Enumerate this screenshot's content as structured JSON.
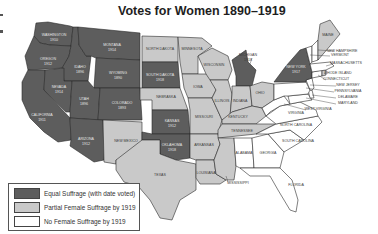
{
  "title": "Votes for Women 1890–1919",
  "colors": {
    "equal": "#5d5d5d",
    "partial": "#c9c9c9",
    "none": "#ffffff"
  },
  "legend": {
    "items": [
      {
        "key": "equal",
        "label": "Equal Suffrage (with date voted)"
      },
      {
        "key": "partial",
        "label": "Partial Female Suffrage by 1919"
      },
      {
        "key": "none",
        "label": "No Female Suffrage by 1919"
      }
    ]
  },
  "states": [
    {
      "id": "washington",
      "name": "WASHINGTON",
      "year": "1910",
      "status": "equal"
    },
    {
      "id": "oregon",
      "name": "OREGON",
      "year": "1912",
      "status": "equal"
    },
    {
      "id": "california",
      "name": "CALIFORNIA",
      "year": "1911",
      "status": "equal"
    },
    {
      "id": "idaho",
      "name": "IDAHO",
      "year": "1896",
      "status": "equal"
    },
    {
      "id": "nevada",
      "name": "NEVADA",
      "year": "1914",
      "status": "equal"
    },
    {
      "id": "montana",
      "name": "MONTANA",
      "year": "1914",
      "status": "equal"
    },
    {
      "id": "wyoming",
      "name": "WYOMING",
      "year": "1890",
      "status": "equal"
    },
    {
      "id": "utah",
      "name": "UTAH",
      "year": "1896",
      "status": "equal"
    },
    {
      "id": "colorado",
      "name": "COLORADO",
      "year": "1893",
      "status": "equal"
    },
    {
      "id": "arizona",
      "name": "ARIZONA",
      "year": "1912",
      "status": "equal"
    },
    {
      "id": "new-mexico",
      "name": "NEW MEXICO",
      "year": "",
      "status": "partial"
    },
    {
      "id": "north-dakota",
      "name": "NORTH DAKOTA",
      "year": "",
      "status": "partial"
    },
    {
      "id": "south-dakota",
      "name": "SOUTH DAKOTA",
      "year": "1918",
      "status": "equal"
    },
    {
      "id": "nebraska",
      "name": "NEBRASKA",
      "year": "",
      "status": "partial"
    },
    {
      "id": "kansas",
      "name": "KANSAS",
      "year": "1912",
      "status": "equal"
    },
    {
      "id": "oklahoma",
      "name": "OKLAHOMA",
      "year": "1918",
      "status": "equal"
    },
    {
      "id": "texas",
      "name": "TEXAS",
      "year": "",
      "status": "partial"
    },
    {
      "id": "minnesota",
      "name": "MINNESOTA",
      "year": "",
      "status": "partial"
    },
    {
      "id": "iowa",
      "name": "IOWA",
      "year": "",
      "status": "partial"
    },
    {
      "id": "missouri",
      "name": "MISSOURI",
      "year": "",
      "status": "partial"
    },
    {
      "id": "arkansas",
      "name": "ARKANSAS",
      "year": "",
      "status": "partial"
    },
    {
      "id": "louisiana",
      "name": "LOUISIANA",
      "year": "",
      "status": "partial"
    },
    {
      "id": "wisconsin",
      "name": "WISCONSIN",
      "year": "",
      "status": "partial"
    },
    {
      "id": "illinois",
      "name": "ILLINOIS",
      "year": "",
      "status": "partial"
    },
    {
      "id": "michigan",
      "name": "MICHIGAN",
      "year": "1918",
      "status": "equal"
    },
    {
      "id": "indiana",
      "name": "INDIANA",
      "year": "",
      "status": "partial"
    },
    {
      "id": "ohio",
      "name": "OHIO",
      "year": "",
      "status": "partial"
    },
    {
      "id": "kentucky",
      "name": "KENTUCKY",
      "year": "",
      "status": "partial"
    },
    {
      "id": "tennessee",
      "name": "TENNESSEE",
      "year": "",
      "status": "partial"
    },
    {
      "id": "mississippi",
      "name": "MISSISSIPPI",
      "year": "",
      "status": "partial"
    },
    {
      "id": "alabama",
      "name": "ALABAMA",
      "year": "",
      "status": "none"
    },
    {
      "id": "georgia",
      "name": "GEORGIA",
      "year": "",
      "status": "none"
    },
    {
      "id": "florida",
      "name": "FLORIDA",
      "year": "",
      "status": "none"
    },
    {
      "id": "south-carolina",
      "name": "SOUTH CAROLINA",
      "year": "",
      "status": "none"
    },
    {
      "id": "north-carolina",
      "name": "NORTH CAROLINA",
      "year": "",
      "status": "none"
    },
    {
      "id": "virginia",
      "name": "VIRGINIA",
      "year": "",
      "status": "none"
    },
    {
      "id": "west-virginia",
      "name": "WEST VIRGINIA",
      "year": "",
      "status": "none"
    },
    {
      "id": "maryland",
      "name": "MARYLAND",
      "year": "",
      "status": "none"
    },
    {
      "id": "delaware",
      "name": "DELAWARE",
      "year": "",
      "status": "none"
    },
    {
      "id": "pennsylvania",
      "name": "PENNSYLVANIA",
      "year": "",
      "status": "none"
    },
    {
      "id": "new-jersey",
      "name": "NEW JERSEY",
      "year": "",
      "status": "none"
    },
    {
      "id": "new-york",
      "name": "NEW YORK",
      "year": "1917",
      "status": "equal"
    },
    {
      "id": "connecticut",
      "name": "CONNECTICUT",
      "year": "",
      "status": "none"
    },
    {
      "id": "rhode-island",
      "name": "RHODE ISLAND",
      "year": "",
      "status": "partial"
    },
    {
      "id": "massachusetts",
      "name": "MASSACHUSETTS",
      "year": "",
      "status": "none"
    },
    {
      "id": "vermont",
      "name": "VERMONT",
      "year": "",
      "status": "none"
    },
    {
      "id": "new-hampshire",
      "name": "NEW HAMPSHIRE",
      "year": "",
      "status": "none"
    },
    {
      "id": "maine",
      "name": "MAINE",
      "year": "",
      "status": "partial"
    }
  ]
}
